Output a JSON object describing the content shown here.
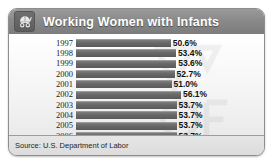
{
  "header": {
    "title": "Working Women with Infants",
    "icon": "stroller-icon"
  },
  "footer": {
    "source": "Source: U.S. Department of Labor"
  },
  "colors": {
    "header_band": "#8a8a8a",
    "bar": "#686868",
    "panel_border": "#8e8e8e",
    "footer": "#dcdcdc",
    "text": "#111111"
  },
  "chart_data": {
    "type": "bar",
    "orientation": "horizontal",
    "title": "Working Women with Infants",
    "xlabel": "",
    "ylabel": "",
    "categories": [
      "1997",
      "1998",
      "1999",
      "2000",
      "2001",
      "2002",
      "2003",
      "2004",
      "2005",
      "2006"
    ],
    "values": [
      50.6,
      53.4,
      53.6,
      52.7,
      51.0,
      56.1,
      53.7,
      53.7,
      53.7,
      53.7
    ],
    "value_labels": [
      "50.6%",
      "53.4%",
      "53.6%",
      "52.7%",
      "51.0%",
      "56.1%",
      "53.7%",
      "53.7%",
      "53.7%",
      "53.7%"
    ],
    "xlim": [
      0,
      60
    ],
    "grid": false,
    "legend": null,
    "source": "Source: U.S. Department of Labor"
  }
}
